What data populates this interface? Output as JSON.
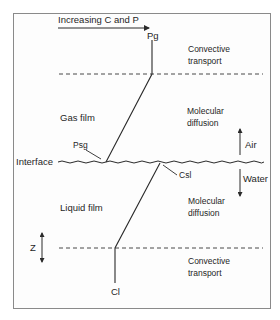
{
  "diagram": {
    "top_arrow_label": "Increasing C and P",
    "labels": {
      "pg": "Pg",
      "psg": "Psg",
      "csl": "Csl",
      "cl": "Cl",
      "interface": "Interface",
      "gas_film": "Gas film",
      "liquid_film": "Liquid film",
      "z_axis": "Z"
    },
    "regions": {
      "upper_convective_line1": "Convective",
      "upper_convective_line2": "transport",
      "upper_diffusion_line1": "Molecular",
      "upper_diffusion_line2": "diffusion",
      "lower_diffusion_line1": "Molecular",
      "lower_diffusion_line2": "diffusion",
      "lower_convective_line1": "Convective",
      "lower_convective_line2": "transport"
    },
    "phases": {
      "air": "Air",
      "water": "Water"
    },
    "colors": {
      "line": "#2a2a2a",
      "frame": "#8a8a8a",
      "background": "#ffffff"
    }
  }
}
